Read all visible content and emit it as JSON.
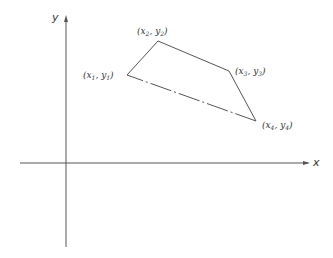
{
  "diagram": {
    "type": "coordinate-plane-polygon",
    "axes": {
      "x_label": "x",
      "y_label": "y",
      "origin_px": [
        66,
        163
      ]
    },
    "vertices": [
      {
        "name": "(x1, y1)",
        "var_x": "x",
        "sub_x": "1",
        "var_y": "y",
        "sub_y": "1",
        "px": [
          127,
          75
        ]
      },
      {
        "name": "(x2, y2)",
        "var_x": "x",
        "sub_x": "2",
        "var_y": "y",
        "sub_y": "2",
        "px": [
          158,
          41
        ]
      },
      {
        "name": "(x3, y3)",
        "var_x": "x",
        "sub_x": "3",
        "var_y": "y",
        "sub_y": "3",
        "px": [
          229,
          71
        ]
      },
      {
        "name": "(x4, y4)",
        "var_x": "x",
        "sub_x": "4",
        "var_y": "y",
        "sub_y": "4",
        "px": [
          256,
          121
        ]
      }
    ],
    "edges": [
      {
        "from": 1,
        "to": 2,
        "style": "solid"
      },
      {
        "from": 2,
        "to": 3,
        "style": "solid"
      },
      {
        "from": 3,
        "to": 4,
        "style": "solid"
      },
      {
        "from": 4,
        "to": 1,
        "style": "dashed"
      }
    ],
    "stroke_color": "#555555"
  }
}
